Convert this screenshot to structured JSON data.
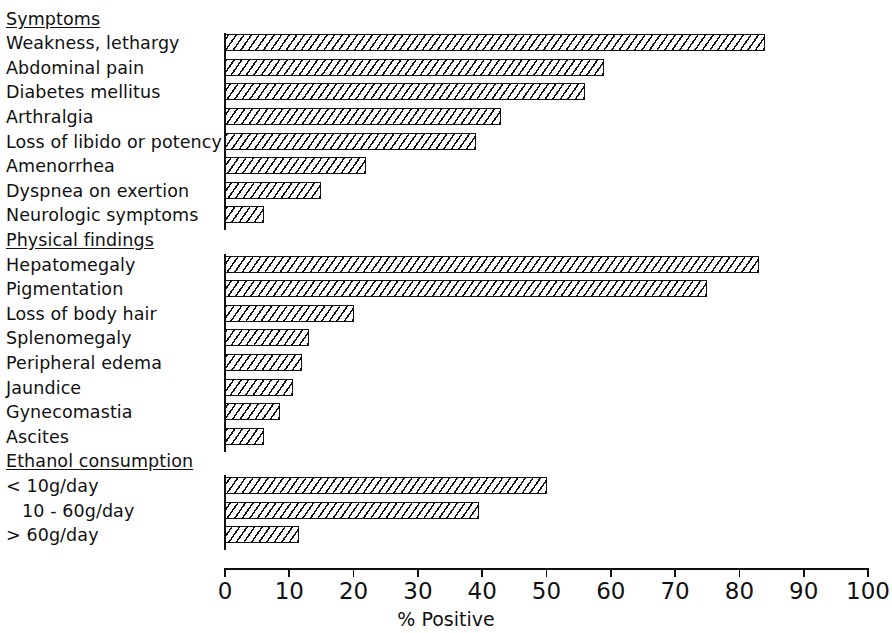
{
  "chart_data": {
    "type": "bar",
    "orientation": "horizontal",
    "title": "",
    "xlabel": "% Positive",
    "ylabel": "",
    "xlim": [
      0,
      100
    ],
    "xticks": [
      0,
      10,
      20,
      30,
      40,
      50,
      60,
      70,
      80,
      90,
      100
    ],
    "xtick_labels": [
      "0",
      "10",
      "20",
      "30",
      "40",
      "50",
      "60",
      "70",
      "80",
      "90",
      "100"
    ],
    "grid": false,
    "legend": null,
    "groups": [
      {
        "name": "Symptoms",
        "items": [
          {
            "label": "Weakness, lethargy",
            "value": 84
          },
          {
            "label": "Abdominal pain",
            "value": 59
          },
          {
            "label": "Diabetes mellitus",
            "value": 56
          },
          {
            "label": "Arthralgia",
            "value": 43
          },
          {
            "label": "Loss of libido or potency",
            "value": 39
          },
          {
            "label": "Amenorrhea",
            "value": 22
          },
          {
            "label": "Dyspnea on exertion",
            "value": 15
          },
          {
            "label": "Neurologic symptoms",
            "value": 6
          }
        ]
      },
      {
        "name": "Physical findings",
        "items": [
          {
            "label": "Hepatomegaly",
            "value": 83
          },
          {
            "label": "Pigmentation",
            "value": 75
          },
          {
            "label": "Loss of body hair",
            "value": 20
          },
          {
            "label": "Splenomegaly",
            "value": 13
          },
          {
            "label": "Peripheral edema",
            "value": 12
          },
          {
            "label": "Jaundice",
            "value": 10.5
          },
          {
            "label": "Gynecomastia",
            "value": 8.5
          },
          {
            "label": "Ascites",
            "value": 6
          }
        ]
      },
      {
        "name": "Ethanol consumption",
        "items": [
          {
            "label": "< 10g/day",
            "value": 50,
            "indent": false
          },
          {
            "label": "10 - 60g/day",
            "value": 39.5,
            "indent": true
          },
          {
            "label": "> 60g/day",
            "value": 11.5,
            "indent": false
          }
        ]
      }
    ]
  },
  "axis": {
    "title": "% Positive"
  }
}
